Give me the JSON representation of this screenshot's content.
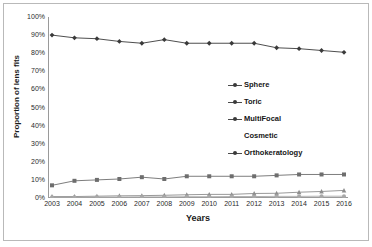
{
  "chart_data": {
    "type": "line",
    "title": "",
    "subtitle": "",
    "xlabel": "Years",
    "ylabel": "Proportion of lens fits",
    "categories": [
      "2003",
      "2004",
      "2005",
      "2006",
      "2007",
      "2008",
      "2009",
      "2010",
      "2011",
      "2012",
      "2013",
      "2014",
      "2015",
      "2016"
    ],
    "x": [
      2003,
      2004,
      2005,
      2006,
      2007,
      2008,
      2009,
      2010,
      2011,
      2012,
      2013,
      2014,
      2015,
      2016
    ],
    "ylim": [
      0,
      100
    ],
    "yticks": [
      "0%",
      "10%",
      "20%",
      "30%",
      "40%",
      "50%",
      "60%",
      "70%",
      "80%",
      "90%",
      "100%"
    ],
    "ytick_values": [
      0,
      10,
      20,
      30,
      40,
      50,
      60,
      70,
      80,
      90,
      100
    ],
    "grid": false,
    "legend_position": "center-right",
    "series": [
      {
        "name": "Sphere",
        "marker": "diamond",
        "color": "#3a3a3a",
        "values": [
          90.0,
          88.5,
          88.0,
          86.5,
          85.5,
          87.5,
          85.5,
          85.5,
          85.5,
          85.5,
          83.0,
          82.5,
          81.5,
          80.5
        ]
      },
      {
        "name": "Toric",
        "marker": "square",
        "color": "#6e6e6e",
        "values": [
          7.0,
          9.5,
          10.0,
          10.5,
          11.5,
          10.5,
          12.0,
          12.0,
          12.0,
          12.0,
          12.5,
          13.0,
          13.0,
          13.0
        ]
      },
      {
        "name": "MultiFocal\nCosmetic",
        "marker": "triangle",
        "color": "#8d8d8d",
        "values": [
          0.8,
          0.8,
          1.0,
          1.2,
          1.3,
          1.5,
          1.8,
          2.0,
          2.0,
          2.5,
          2.6,
          3.2,
          3.6,
          4.2
        ]
      },
      {
        "name": "Orthokeratology",
        "marker": "circle",
        "color": "#a8a8a8",
        "values": [
          0.4,
          0.4,
          0.5,
          0.5,
          0.6,
          0.6,
          0.7,
          0.7,
          0.8,
          0.8,
          0.9,
          0.9,
          1.0,
          1.0
        ]
      }
    ]
  },
  "legend": {
    "items": [
      {
        "label": "Sphere",
        "has_marker": true
      },
      {
        "label": "Toric",
        "has_marker": true
      },
      {
        "label": "MultiFocal",
        "has_marker": true
      },
      {
        "label": "Cosmetic",
        "has_marker": false
      },
      {
        "label": "Orthokeratology",
        "has_marker": true
      }
    ]
  },
  "axes": {
    "x_title": "Years",
    "y_title": "Proportion of lens fits"
  },
  "colors": {
    "axis": "#9a9a9a",
    "frame": "#b9b9b9",
    "text": "#1a1a1a",
    "series_dark": "#3a3a3a",
    "series_mid": "#6e6e6e",
    "series_light": "#a8a8a8",
    "background": "#ffffff"
  }
}
